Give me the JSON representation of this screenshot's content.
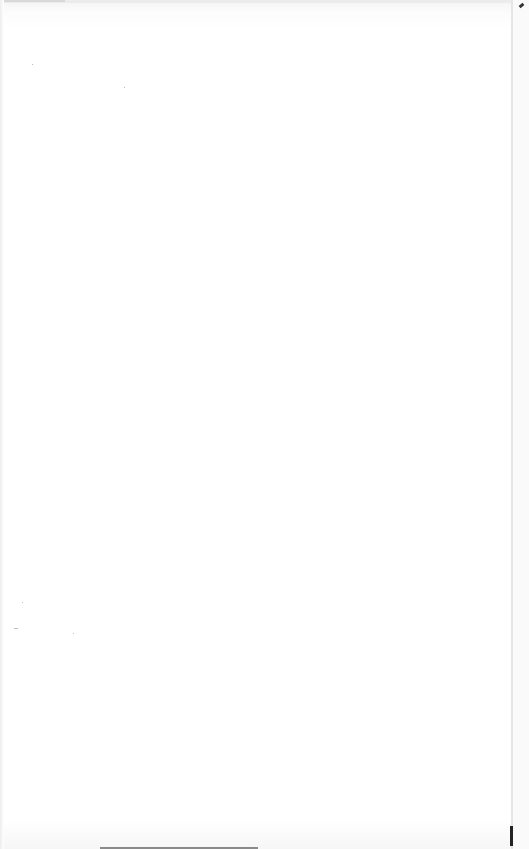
{
  "page": {
    "type": "blank-scanned-page",
    "text": "",
    "background_color": "#ffffff",
    "edge_color": "#e6e6e6",
    "mark_color": "#222222"
  }
}
